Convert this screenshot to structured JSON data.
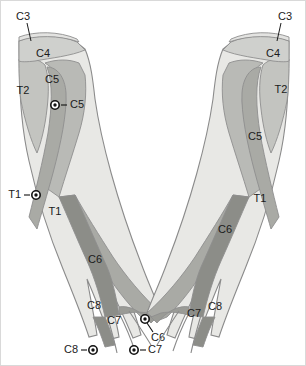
{
  "figure": {
    "background": "#ffffff",
    "frame_color": "#d9d9d9",
    "label_color": "#1b1b1b",
    "outline_color": "#8b8b8b"
  },
  "palette": {
    "band_c3": "#e3e3e1",
    "band_c4": "#cfd0cd",
    "band_c5": "#b9bab6",
    "band_c6": "#a9aaa5",
    "band_c7": "#9a9b96",
    "band_c8": "#8c8d88",
    "band_t1": "#e8e8e5",
    "band_t2": "#c3c4c0",
    "hand_fill": "#b0b1ac",
    "marker_fill": "#ffffff",
    "marker_core": "#111111"
  },
  "left_arm": {
    "name": "left-arm",
    "side_label": "Left arm (viewer's left)",
    "region_labels": [
      {
        "id": "l-c3",
        "text": "C3",
        "x": 22,
        "y": 16,
        "anchor": "middle"
      },
      {
        "id": "l-c4",
        "text": "C4",
        "x": 42,
        "y": 53,
        "anchor": "middle"
      },
      {
        "id": "l-c5",
        "text": "C5",
        "x": 51,
        "y": 79,
        "anchor": "middle"
      },
      {
        "id": "l-t2",
        "text": "T2",
        "x": 22,
        "y": 90,
        "anchor": "middle"
      },
      {
        "id": "l-t1",
        "text": "T1",
        "x": 54,
        "y": 211,
        "anchor": "middle"
      },
      {
        "id": "l-c6",
        "text": "C6",
        "x": 94,
        "y": 259,
        "anchor": "middle"
      },
      {
        "id": "l-c8",
        "text": "C8",
        "x": 93,
        "y": 305,
        "anchor": "middle"
      },
      {
        "id": "l-c7",
        "text": "C7",
        "x": 113,
        "y": 320,
        "anchor": "middle"
      }
    ],
    "markers": [
      {
        "id": "l-mk-c5",
        "text": "C5",
        "cx": 54,
        "cy": 104,
        "label_x": 69,
        "label_y": 104,
        "anchor": "start",
        "leader": "right"
      },
      {
        "id": "l-mk-t1",
        "text": "T1",
        "cx": 35,
        "cy": 194,
        "label_x": 20,
        "label_y": 194,
        "anchor": "end",
        "leader": "left"
      },
      {
        "id": "l-mk-c6",
        "text": "C6",
        "cx": 144,
        "cy": 318,
        "label_x": 150,
        "label_y": 337,
        "anchor": "start",
        "leader": "down-right"
      },
      {
        "id": "l-mk-c7",
        "text": "C7",
        "cx": 133,
        "cy": 349,
        "label_x": 147,
        "label_y": 349,
        "anchor": "start",
        "leader": "right"
      },
      {
        "id": "l-mk-c8",
        "text": "C8",
        "cx": 92,
        "cy": 349,
        "label_x": 77,
        "label_y": 349,
        "anchor": "end",
        "leader": "left"
      }
    ]
  },
  "right_arm": {
    "name": "right-arm",
    "side_label": "Right arm (viewer's right)",
    "region_labels": [
      {
        "id": "r-c3",
        "text": "C3",
        "x": 284,
        "y": 16,
        "anchor": "middle"
      },
      {
        "id": "r-c4",
        "text": "C4",
        "x": 272,
        "y": 53,
        "anchor": "middle"
      },
      {
        "id": "r-t2",
        "text": "T2",
        "x": 280,
        "y": 89,
        "anchor": "middle"
      },
      {
        "id": "r-c5",
        "text": "C5",
        "x": 254,
        "y": 136,
        "anchor": "middle"
      },
      {
        "id": "r-t1",
        "text": "T1",
        "x": 259,
        "y": 198,
        "anchor": "middle"
      },
      {
        "id": "r-c6",
        "text": "C6",
        "x": 224,
        "y": 229,
        "anchor": "middle"
      },
      {
        "id": "r-c7",
        "text": "C7",
        "x": 193,
        "y": 313,
        "anchor": "middle"
      },
      {
        "id": "r-c8",
        "text": "C8",
        "x": 214,
        "y": 306,
        "anchor": "middle"
      }
    ],
    "markers": []
  },
  "legend_levels": [
    "C3",
    "C4",
    "C5",
    "C6",
    "C7",
    "C8",
    "T1",
    "T2"
  ]
}
